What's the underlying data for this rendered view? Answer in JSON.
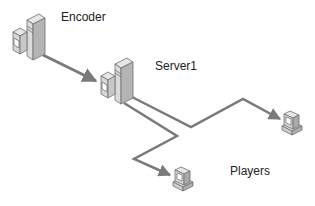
{
  "diagram": {
    "title": "",
    "nodes": [
      {
        "id": "encoder",
        "label": "Encoder",
        "type": "workstation-tower"
      },
      {
        "id": "server1",
        "label": "Server1",
        "type": "workstation-tower"
      },
      {
        "id": "player1",
        "label": "",
        "type": "pc"
      },
      {
        "id": "player2",
        "label": "",
        "type": "pc"
      }
    ],
    "group_labels": [
      {
        "id": "players",
        "label": "Players"
      }
    ],
    "edges": [
      {
        "from": "encoder",
        "to": "server1",
        "arrow": true
      },
      {
        "from": "server1",
        "to": "player1",
        "arrow": true
      },
      {
        "from": "server1",
        "to": "player2",
        "arrow": true
      }
    ],
    "colors": {
      "line": "#7a7a7a",
      "device_light": "#e6e6e6",
      "device_mid": "#c8c8c8",
      "device_dark": "#9a9a9a",
      "outline": "#6e6e6e",
      "text": "#222222"
    }
  }
}
